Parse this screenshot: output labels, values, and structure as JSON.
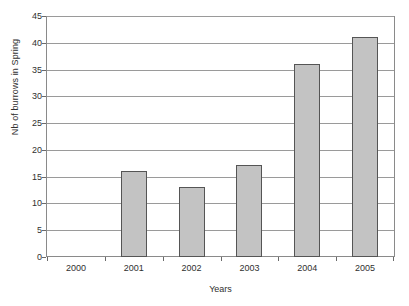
{
  "chart_data": {
    "type": "bar",
    "title": "",
    "xlabel": "Years",
    "ylabel": "Nb of burrows in Spring",
    "categories": [
      "2000",
      "2001",
      "2002",
      "2003",
      "2004",
      "2005"
    ],
    "values": [
      0,
      16.1,
      13.2,
      17.2,
      36.2,
      41.3
    ],
    "ylim": [
      0,
      45
    ],
    "ytick_values": [
      0,
      5,
      10,
      15,
      20,
      25,
      30,
      35,
      40,
      45
    ],
    "ytick_labels": [
      "0",
      "5",
      "10",
      "15",
      "20",
      "25",
      "30",
      "35",
      "40",
      "45"
    ],
    "grid": "horizontal",
    "legend": "none",
    "bar_color": "#c3c3c3",
    "bar_edge_color": "#555555",
    "axis_color": "#8a8a8a",
    "gridline_color": "#9a9a9a",
    "background_color": "#ffffff"
  },
  "artifact": {
    "bottom_strip_text": ""
  }
}
